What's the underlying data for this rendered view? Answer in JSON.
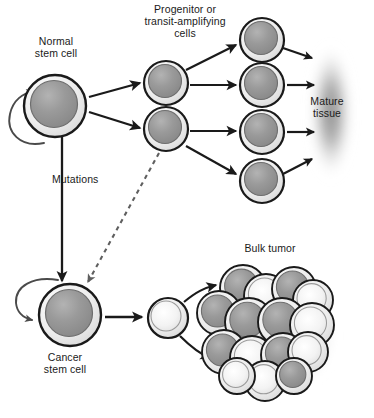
{
  "figure": {
    "background_color": "#ffffff",
    "width": 374,
    "height": 418
  },
  "labels": {
    "normal_stem_cell": "Normal\nstem cell",
    "progenitor": "Progenitor or\ntransit-amplifying\ncells",
    "mature_tissue": "Mature\ntissue",
    "mutations": "Mutations",
    "cancer_stem_cell": "Cancer\nstem cell",
    "bulk_tumor": "Bulk tumor"
  },
  "caption_fragment": "",
  "colors": {
    "outline": "#1a1a1a",
    "cell_rim": "#e8e8e8",
    "nucleus_dark": "#8f8f8f",
    "nucleus_light": "#f2f2f2",
    "arrow": "#1a1a1a",
    "dashed_arrow": "#6b6b6b",
    "mature_tissue_blob": "#8a8a8a",
    "tumor_shadow": "#d4d4d4",
    "text": "#1a1a1a"
  },
  "cells": {
    "normal_stem_cell": {
      "cx": 55,
      "cy": 106,
      "r": 31,
      "nucleus_r": 23,
      "type": "dark"
    },
    "progenitors": [
      {
        "cx": 166,
        "cy": 83,
        "r": 22,
        "nucleus_r": 16,
        "type": "dark"
      },
      {
        "cx": 166,
        "cy": 129,
        "r": 22,
        "nucleus_r": 16,
        "type": "dark"
      }
    ],
    "differentiated": [
      {
        "cx": 262,
        "cy": 40,
        "r": 22,
        "nucleus_r": 16,
        "type": "dark"
      },
      {
        "cx": 262,
        "cy": 85,
        "r": 22,
        "nucleus_r": 16,
        "type": "dark"
      },
      {
        "cx": 262,
        "cy": 132,
        "r": 22,
        "nucleus_r": 16,
        "type": "dark"
      },
      {
        "cx": 262,
        "cy": 181,
        "r": 22,
        "nucleus_r": 16,
        "type": "dark"
      }
    ],
    "cancer_stem_cell": {
      "cx": 70,
      "cy": 315,
      "r": 31,
      "nucleus_r": 23,
      "type": "dark"
    },
    "tumor_seed_cell": {
      "cx": 168,
      "cy": 318,
      "r": 20,
      "nucleus_r": 15,
      "type": "light"
    },
    "bulk_tumor_cells": [
      {
        "cx": 243,
        "cy": 288,
        "r": 23,
        "type": "dark"
      },
      {
        "cx": 266,
        "cy": 296,
        "r": 22,
        "type": "light"
      },
      {
        "cx": 294,
        "cy": 289,
        "r": 22,
        "type": "dark"
      },
      {
        "cx": 313,
        "cy": 300,
        "r": 20,
        "type": "light"
      },
      {
        "cx": 219,
        "cy": 313,
        "r": 22,
        "type": "dark"
      },
      {
        "cx": 249,
        "cy": 322,
        "r": 24,
        "type": "dark"
      },
      {
        "cx": 282,
        "cy": 322,
        "r": 24,
        "type": "dark"
      },
      {
        "cx": 312,
        "cy": 325,
        "r": 22,
        "type": "light"
      },
      {
        "cx": 224,
        "cy": 352,
        "r": 22,
        "type": "dark"
      },
      {
        "cx": 252,
        "cy": 358,
        "r": 22,
        "type": "light"
      },
      {
        "cx": 283,
        "cy": 355,
        "r": 22,
        "type": "dark"
      },
      {
        "cx": 308,
        "cy": 352,
        "r": 20,
        "type": "light"
      },
      {
        "cx": 265,
        "cy": 381,
        "r": 20,
        "type": "light"
      },
      {
        "cx": 237,
        "cy": 376,
        "r": 18,
        "type": "light"
      },
      {
        "cx": 294,
        "cy": 376,
        "r": 18,
        "type": "dark"
      }
    ]
  },
  "arrows": {
    "self_renewal_normal": {
      "kind": "curved-loop",
      "at": "left of normal stem cell"
    },
    "self_renewal_cancer": {
      "kind": "curved-loop",
      "at": "left of cancer stem cell"
    },
    "stem_to_progenitor_count": 2,
    "progenitor_to_differentiated_count": 4,
    "differentiated_to_tissue_count": 4,
    "mutations_arrow": {
      "kind": "straight-down",
      "label": "Mutations"
    },
    "progenitor_to_cancer_dashed": {
      "kind": "dashed-diagonal"
    },
    "cancer_to_seed": {
      "kind": "straight-right"
    },
    "seed_to_tumor_count": 2
  }
}
